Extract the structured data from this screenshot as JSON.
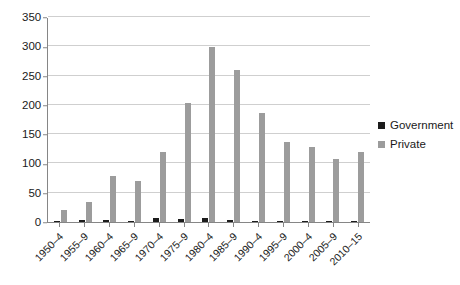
{
  "chart_data": {
    "type": "bar",
    "title": "",
    "subtitle": "",
    "xlabel": "",
    "ylabel": "",
    "ylim": [
      0,
      350
    ],
    "ytick_step": 50,
    "yticks": [
      "0",
      "50",
      "100",
      "150",
      "200",
      "250",
      "300",
      "350"
    ],
    "grid": true,
    "legend_position": "right",
    "categories": [
      "1950–4",
      "1955–9",
      "1960–4",
      "1965–9",
      "1970–4",
      "1975–9",
      "1980–4",
      "1985–9",
      "1990–4",
      "1995–9",
      "2000–4",
      "2005–9",
      "2010–15"
    ],
    "series": [
      {
        "name": "Government",
        "color": "#1c1c1c",
        "values": [
          1,
          3,
          3,
          2,
          7,
          5,
          7,
          4,
          2,
          2,
          2,
          2,
          2
        ]
      },
      {
        "name": "Private",
        "color": "#9c9c9c",
        "values": [
          20,
          35,
          78,
          70,
          119,
          203,
          298,
          259,
          186,
          137,
          128,
          107,
          120
        ]
      }
    ]
  },
  "legend": {
    "items": [
      {
        "label": "Government",
        "swatch": "government-swatch"
      },
      {
        "label": "Private",
        "swatch": "private-swatch"
      }
    ]
  },
  "colors": {
    "government": "#1c1c1c",
    "private": "#9c9c9c",
    "gridline": "#cfcfcf",
    "axis": "#868686",
    "background": "#ffffff",
    "text": "#1a1a1a"
  }
}
